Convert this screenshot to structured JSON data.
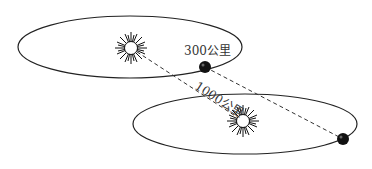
{
  "diagram": {
    "labels": {
      "orbit_radius": "300公里",
      "distance": "1000公里"
    },
    "systems": [
      {
        "name": "upper-system",
        "star": {
          "cx": 131,
          "cy": 48
        },
        "orbit": {
          "cx": 130,
          "cy": 47,
          "rx": 112,
          "ry": 31
        },
        "planet": {
          "cx": 205,
          "cy": 67
        }
      },
      {
        "name": "lower-system",
        "star": {
          "cx": 243,
          "cy": 121
        },
        "orbit": {
          "cx": 245,
          "cy": 124,
          "rx": 112,
          "ry": 30
        },
        "planet": {
          "cx": 343,
          "cy": 139
        }
      }
    ],
    "colors": {
      "line": "#222222",
      "planet": "#111111",
      "background": "#ffffff"
    }
  }
}
